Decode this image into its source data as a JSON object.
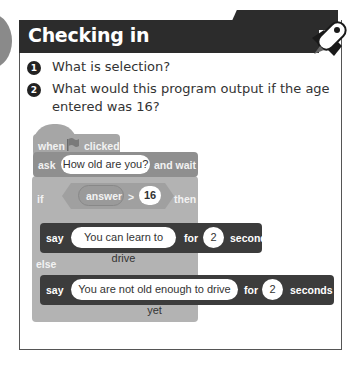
{
  "header": {
    "title": "Checking in",
    "icon": "rocket-icon"
  },
  "questions": [
    {
      "number": "1",
      "text": "What is selection?"
    },
    {
      "number": "2",
      "text_line1": "What would this program output if the age",
      "text_line2": "entered was 16?"
    }
  ],
  "program": {
    "hat": {
      "label_before": "when",
      "icon": "green-flag-icon",
      "label_after": "clicked"
    },
    "ask": {
      "label": "ask",
      "input": "How old are you?",
      "suffix": "and wait"
    },
    "if": {
      "label": "if",
      "operand": "answer",
      "operator": ">",
      "value": "16",
      "suffix": "then"
    },
    "say1": {
      "label": "say",
      "input": "You can learn to drive",
      "for": "for",
      "seconds_value": "2",
      "seconds": "seconds"
    },
    "else": {
      "label": "else"
    },
    "say2": {
      "label": "say",
      "input": "You are not old enough to drive yet",
      "for": "for",
      "seconds_value": "2",
      "seconds": "seconds"
    }
  },
  "colors": {
    "header": "#2c2c2c",
    "hat_block": "#a6a6a6",
    "ask_block": "#8f8f8f",
    "if_block": "#b3b3b3",
    "say_block": "#3c3c3c"
  }
}
